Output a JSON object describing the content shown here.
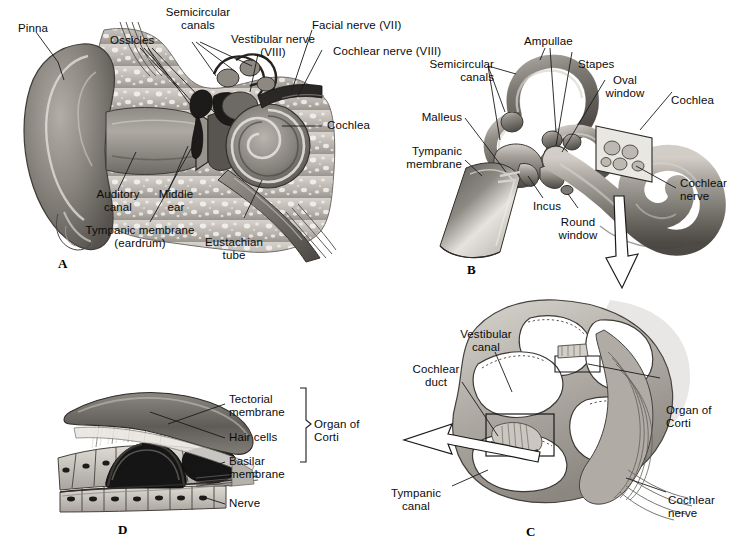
{
  "figure": {
    "background_color": "#ffffff",
    "text_color": "#0b0b0b",
    "line_color": "#1a1a1a"
  },
  "panels": [
    {
      "id": "A",
      "letter": "A",
      "caption": "Cross section of the outer, middle and inner ear",
      "labels": [
        {
          "name": "pinna",
          "text": "Pinna"
        },
        {
          "name": "ossicles",
          "text": "Ossicles"
        },
        {
          "name": "semicircular-canals",
          "text": "Semicircular\ncanals"
        },
        {
          "name": "vestibular-nerve",
          "text": "Vestibular nerve\n(VIII)"
        },
        {
          "name": "facial-nerve",
          "text": "Facial nerve (VII)"
        },
        {
          "name": "cochlear-nerve",
          "text": "Cochlear nerve (VIII)"
        },
        {
          "name": "cochlea",
          "text": "Cochlea"
        },
        {
          "name": "auditory-canal",
          "text": "Auditory\ncanal"
        },
        {
          "name": "middle-ear",
          "text": "Middle\near"
        },
        {
          "name": "tympanic-membrane",
          "text": "Tympanic membrane\n(eardrum)"
        },
        {
          "name": "eustachian-tube",
          "text": "Eustachian\ntube"
        }
      ]
    },
    {
      "id": "B",
      "letter": "B",
      "caption": "The middle ear ossicles and the bony labyrinth",
      "labels": [
        {
          "name": "ampullae",
          "text": "Ampullae"
        },
        {
          "name": "stapes",
          "text": "Stapes"
        },
        {
          "name": "oval-window",
          "text": "Oval\nwindow"
        },
        {
          "name": "cochlea",
          "text": "Cochlea"
        },
        {
          "name": "semicircular-canals",
          "text": "Semicircular\ncanals"
        },
        {
          "name": "malleus",
          "text": "Malleus"
        },
        {
          "name": "tympanic-membrane",
          "text": "Tympanic\nmembrane"
        },
        {
          "name": "incus",
          "text": "Incus"
        },
        {
          "name": "round-window",
          "text": "Round\nwindow"
        },
        {
          "name": "cochlear-nerve",
          "text": "Cochlear\nnerve"
        }
      ]
    },
    {
      "id": "C",
      "letter": "C",
      "caption": "Cross section through the cochlea",
      "labels": [
        {
          "name": "vestibular-canal",
          "text": "Vestibular\ncanal"
        },
        {
          "name": "cochlear-duct",
          "text": "Cochlear\nduct"
        },
        {
          "name": "organ-of-corti",
          "text": "Organ of\nCorti"
        },
        {
          "name": "tympanic-canal",
          "text": "Tympanic\ncanal"
        },
        {
          "name": "cochlear-nerve",
          "text": "Cochlear\nnerve"
        }
      ]
    },
    {
      "id": "D",
      "letter": "D",
      "caption": "Detail of the organ of Corti",
      "labels": [
        {
          "name": "tectorial-membrane",
          "text": "Tectorial\nmembrane"
        },
        {
          "name": "hair-cells",
          "text": "Hair cells"
        },
        {
          "name": "basilar-membrane",
          "text": "Basilar\nmembrane"
        },
        {
          "name": "organ-of-corti",
          "text": "Organ of\nCorti"
        },
        {
          "name": "nerve",
          "text": "Nerve"
        }
      ]
    }
  ],
  "labels_flat": {
    "a_pinna": "Pinna",
    "a_ossicles": "Ossicles",
    "a_semicircular_canals_1": "Semicircular",
    "a_semicircular_canals_2": "canals",
    "a_vestibular_nerve_1": "Vestibular nerve",
    "a_vestibular_nerve_2": "(VIII)",
    "a_facial_nerve": "Facial nerve (VII)",
    "a_cochlear_nerve": "Cochlear nerve (VIII)",
    "a_cochlea": "Cochlea",
    "a_auditory_canal_1": "Auditory",
    "a_auditory_canal_2": "canal",
    "a_middle_ear_1": "Middle",
    "a_middle_ear_2": "ear",
    "a_tympanic_membrane_1": "Tympanic membrane",
    "a_tympanic_membrane_2": "(eardrum)",
    "a_eustachian_tube_1": "Eustachian",
    "a_eustachian_tube_2": "tube",
    "a_letter": "A",
    "b_ampullae": "Ampullae",
    "b_stapes": "Stapes",
    "b_oval_window_1": "Oval",
    "b_oval_window_2": "window",
    "b_cochlea": "Cochlea",
    "b_semicircular_canals_1": "Semicircular",
    "b_semicircular_canals_2": "canals",
    "b_malleus": "Malleus",
    "b_tympanic_membrane_1": "Tympanic",
    "b_tympanic_membrane_2": "membrane",
    "b_incus": "Incus",
    "b_round_window_1": "Round",
    "b_round_window_2": "window",
    "b_cochlear_nerve_1": "Cochlear",
    "b_cochlear_nerve_2": "nerve",
    "b_letter": "B",
    "c_vestibular_canal_1": "Vestibular",
    "c_vestibular_canal_2": "canal",
    "c_cochlear_duct_1": "Cochlear",
    "c_cochlear_duct_2": "duct",
    "c_organ_of_corti_1": "Organ of",
    "c_organ_of_corti_2": "Corti",
    "c_tympanic_canal_1": "Tympanic",
    "c_tympanic_canal_2": "canal",
    "c_cochlear_nerve_1": "Cochlear",
    "c_cochlear_nerve_2": "nerve",
    "c_letter": "C",
    "d_tectorial_membrane_1": "Tectorial",
    "d_tectorial_membrane_2": "membrane",
    "d_hair_cells": "Hair cells",
    "d_basilar_membrane_1": "Basilar",
    "d_basilar_membrane_2": "membrane",
    "d_organ_of_corti_1": "Organ of",
    "d_organ_of_corti_2": "Corti",
    "d_nerve": "Nerve",
    "d_letter": "D"
  },
  "colors": {
    "ink": "#1a1a1a",
    "tissue_light": "#cfcbc4",
    "tissue_mid": "#9b968f",
    "tissue_dark": "#6b6761",
    "tissue_darker": "#4a4742",
    "bone_speck": "#f2f0ec",
    "white": "#ffffff",
    "black": "#151515"
  }
}
